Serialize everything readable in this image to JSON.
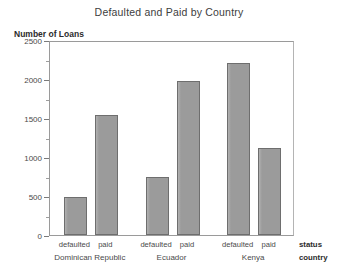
{
  "chart_data": {
    "type": "bar",
    "title": "Defaulted and Paid by Country",
    "xlabel": "",
    "ylabel": "Number of Loans",
    "ylim": [
      0,
      2500
    ],
    "ytick_values": [
      0,
      500,
      1000,
      1500,
      2000,
      2500
    ],
    "ytick_labels": [
      "0",
      "500",
      "1000",
      "1500",
      "2000",
      "2500"
    ],
    "yminor_ticks": [
      250,
      750,
      1250,
      1750,
      2250
    ],
    "grid": false,
    "legend": null,
    "axis_group_labels": {
      "status": "status",
      "country": "country"
    },
    "categories": [
      "Dominican Republic",
      "Ecuador",
      "Kenya"
    ],
    "subcategories": [
      "defaulted",
      "paid"
    ],
    "bars": [
      {
        "country": "Dominican Republic",
        "status": "defaulted",
        "value": 490
      },
      {
        "country": "Dominican Republic",
        "status": "paid",
        "value": 1540
      },
      {
        "country": "Ecuador",
        "status": "defaulted",
        "value": 750
      },
      {
        "country": "Ecuador",
        "status": "paid",
        "value": 1970
      },
      {
        "country": "Kenya",
        "status": "defaulted",
        "value": 2210
      },
      {
        "country": "Kenya",
        "status": "paid",
        "value": 1110
      }
    ],
    "colors": {
      "bar_fill": "#9c9c9c",
      "bar_border": "#6e6e6e",
      "axis": "#9a9a9a",
      "text": "#404040",
      "background": "#ffffff"
    }
  }
}
